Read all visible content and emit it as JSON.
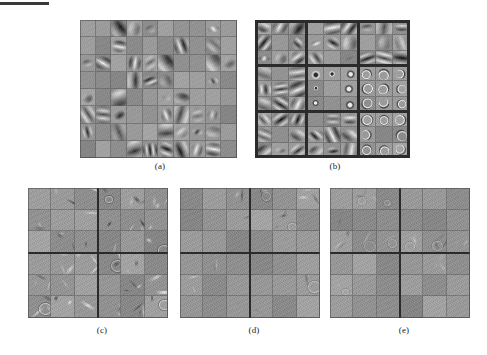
{
  "figure": {
    "background_color": "#ffffff",
    "panel_background": "#9a9a9a",
    "separator_color": "#2b2b2b",
    "caption_color": "#1d1d1d",
    "scan_artifact": {
      "name": "scan-edge-bar",
      "color": "#3a3a3a",
      "x": 0,
      "y": 2,
      "width": 49,
      "height": 3
    }
  },
  "panels": [
    {
      "id": "a",
      "caption": "(a)",
      "x": 80,
      "y": 20,
      "width": 157,
      "height": 138,
      "caption_x": 148,
      "caption_y": 161,
      "grid_cols": 10,
      "grid_rows": 8,
      "block_cols": 1,
      "block_rows": 1,
      "description": "Gabor-like oriented bandpass filters, dense 10x8 tiling",
      "filter_kind": "gabor",
      "fill_density": 0.55,
      "contrast": 1.0
    },
    {
      "id": "b",
      "caption": "(b)",
      "x": 255,
      "y": 20,
      "width": 155,
      "height": 138,
      "caption_x": 323,
      "caption_y": 161,
      "grid_cols": 9,
      "grid_rows": 9,
      "block_cols": 3,
      "block_rows": 3,
      "description": "3x3 blocks of 3x3 filters: edges, centre-surround blobs, crescents",
      "filter_kind": "mixed",
      "fill_density": 0.85,
      "contrast": 1.0
    },
    {
      "id": "c",
      "caption": "(c)",
      "x": 28,
      "y": 188,
      "width": 140,
      "height": 130,
      "caption_x": 90,
      "caption_y": 325,
      "grid_cols": 6,
      "grid_rows": 6,
      "block_cols": 2,
      "block_rows": 2,
      "description": "6x6 grid in 2x2 blocks, high-frequency sparse structures",
      "filter_kind": "sparse",
      "fill_density": 0.7,
      "contrast": 0.7
    },
    {
      "id": "d",
      "caption": "(d)",
      "x": 180,
      "y": 188,
      "width": 140,
      "height": 130,
      "caption_x": 242,
      "caption_y": 325,
      "grid_cols": 6,
      "grid_rows": 6,
      "block_cols": 2,
      "block_rows": 2,
      "description": "6x6 grid in 2x2 blocks, faint sparse structures mostly upper-left",
      "filter_kind": "sparse",
      "fill_density": 0.35,
      "contrast": 0.45
    },
    {
      "id": "e",
      "caption": "(e)",
      "x": 330,
      "y": 188,
      "width": 140,
      "height": 130,
      "caption_x": 392,
      "caption_y": 325,
      "grid_cols": 6,
      "grid_rows": 6,
      "block_cols": 2,
      "block_rows": 2,
      "description": "6x6 grid in 2x2 blocks, nearly uniform gray, very faint residual texture",
      "filter_kind": "sparse",
      "fill_density": 0.18,
      "contrast": 0.3
    }
  ]
}
